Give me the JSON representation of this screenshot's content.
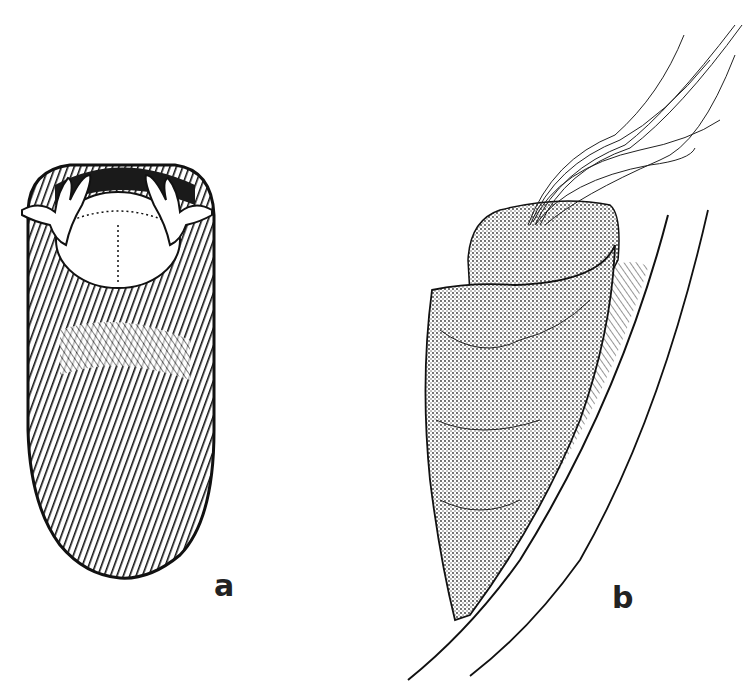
{
  "figure": {
    "panels": [
      {
        "id": "a",
        "label": "a",
        "subject": "tube/case viewed from above with open aperture and tentacle-like appendages"
      },
      {
        "id": "b",
        "label": "b",
        "subject": "conical case attached to a stalk with emerging filaments"
      }
    ]
  },
  "colors": {
    "background": "#ffffff",
    "ink": "#1a1a1a"
  }
}
